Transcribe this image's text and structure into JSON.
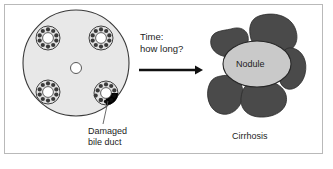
{
  "figure": {
    "title_visible": false,
    "background_color": "#ffffff",
    "border_color": "#b9b9b9"
  },
  "left_panel": {
    "name": "liver-lobule",
    "lobule": {
      "fill_color": "#e8e8e8",
      "stroke_color": "#3a3a3a",
      "center_x": 76,
      "center_y": 63,
      "radius": 53
    },
    "central_vein": {
      "fill_color": "#ffffff",
      "stroke_color": "#555555",
      "center_x": 76,
      "center_y": 68,
      "radius": 5.5
    },
    "portal_triads": [
      {
        "id": "triad-top-left",
        "cx": 48,
        "cy": 38,
        "radius": 12,
        "damaged": false
      },
      {
        "id": "triad-top-right",
        "cx": 101,
        "cy": 38,
        "radius": 12,
        "damaged": false
      },
      {
        "id": "triad-bottom-left",
        "cx": 48,
        "cy": 92,
        "radius": 12,
        "damaged": false
      },
      {
        "id": "triad-bottom-right",
        "cx": 106,
        "cy": 93,
        "radius": 12,
        "damaged": true
      }
    ],
    "triad_colors": {
      "ring_fill": "#e2e2e2",
      "ring_stroke": "#2e2e2e",
      "lumen_fill": "#ffffff",
      "cell_fill": "#3a3a3a",
      "damaged_fill": "#000000"
    },
    "callout": {
      "label_line_1": "Damaged",
      "label_line_2": "bile duct",
      "leader_color": "#5a5a5a",
      "leader_from_x": 108,
      "leader_from_y": 101,
      "leader_to_x": 103,
      "leader_to_y": 124
    }
  },
  "transition": {
    "name": "time-arrow",
    "text_line_1": "Time:",
    "text_line_2": "how long?",
    "arrow": {
      "color": "#111111",
      "start_x": 139,
      "end_x": 201,
      "y": 70,
      "thickness": 2.6
    }
  },
  "right_panel": {
    "name": "cirrhosis",
    "caption": "Cirrhosis",
    "nodule": {
      "label": "Nodule",
      "fill_color": "#c9c9c9",
      "stroke_color": "#262626",
      "cx": 257,
      "cy": 64,
      "rx": 34,
      "ry": 23
    },
    "fibrous_bands": {
      "fill_color": "#4a4a4a",
      "stroke_color": "#2b2b2b",
      "count": 5
    }
  },
  "palette": {
    "ink": "#1c1c1c",
    "lobule_gray": "#e8e8e8",
    "nodule_gray": "#c9c9c9",
    "fibrosis_dark": "#4a4a4a",
    "frame_gray": "#b9b9b9"
  }
}
